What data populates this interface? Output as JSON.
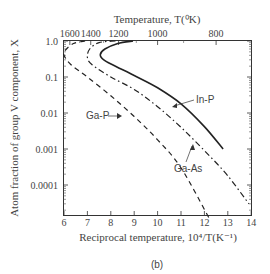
{
  "caption": "(b)",
  "chart_data": {
    "type": "line",
    "title": "",
    "xlabel": "Reciprocal temperature, 10⁴/T(K⁻¹)",
    "ylabel": "Atom fraction of group V component, X",
    "top_xlabel": "Temperature, T(⁰K)",
    "xlim": [
      6,
      14
    ],
    "ylim": [
      1e-05,
      1.0
    ],
    "yscale": "log",
    "x_ticks": [
      "6",
      "7",
      "8",
      "9",
      "10",
      "11",
      "12",
      "13",
      "14"
    ],
    "y_ticks": [
      "1.0",
      "0.1",
      "0.01",
      "0.001",
      "0.0001"
    ],
    "top_ticks": [
      "1600",
      "1400",
      "1200",
      "1000",
      "800"
    ],
    "grid": false,
    "legend": "inline labels with arrows",
    "series": [
      {
        "name": "In-P",
        "style": "solid",
        "points": [
          [
            8.95,
            1.0
          ],
          [
            8.3,
            0.85
          ],
          [
            7.75,
            0.6
          ],
          [
            7.55,
            0.42
          ],
          [
            7.7,
            0.3
          ],
          [
            8.2,
            0.2
          ],
          [
            9.0,
            0.11
          ],
          [
            10.0,
            0.05
          ],
          [
            11.0,
            0.018
          ],
          [
            12.0,
            0.0042
          ],
          [
            12.8,
            0.001
          ]
        ]
      },
      {
        "name": "Ga-As",
        "style": "dash-dot",
        "points": [
          [
            8.2,
            1.0
          ],
          [
            7.5,
            0.9
          ],
          [
            7.1,
            0.6
          ],
          [
            7.0,
            0.35
          ],
          [
            7.2,
            0.22
          ],
          [
            8.0,
            0.1
          ],
          [
            9.0,
            0.045
          ],
          [
            10.0,
            0.015
          ],
          [
            11.0,
            0.004
          ],
          [
            12.0,
            0.0009
          ],
          [
            13.0,
            0.00018
          ],
          [
            13.9,
            3e-05
          ]
        ]
      },
      {
        "name": "Ga-P",
        "style": "dashed",
        "points": [
          [
            6.9,
            1.0
          ],
          [
            6.4,
            0.85
          ],
          [
            6.05,
            0.55
          ],
          [
            6.0,
            0.4
          ],
          [
            6.3,
            0.22
          ],
          [
            7.0,
            0.1
          ],
          [
            8.0,
            0.03
          ],
          [
            9.0,
            0.008
          ],
          [
            10.0,
            0.0018
          ],
          [
            11.0,
            0.0003
          ],
          [
            12.2,
            1.2e-05
          ]
        ]
      }
    ],
    "annotations": [
      {
        "text": "In-P",
        "x": 11.6,
        "y": 0.045
      },
      {
        "text": "Ga-As",
        "x": 11.3,
        "y": 0.0015
      },
      {
        "text": "Ga-P",
        "x": 7.1,
        "y": 0.0028
      }
    ]
  }
}
